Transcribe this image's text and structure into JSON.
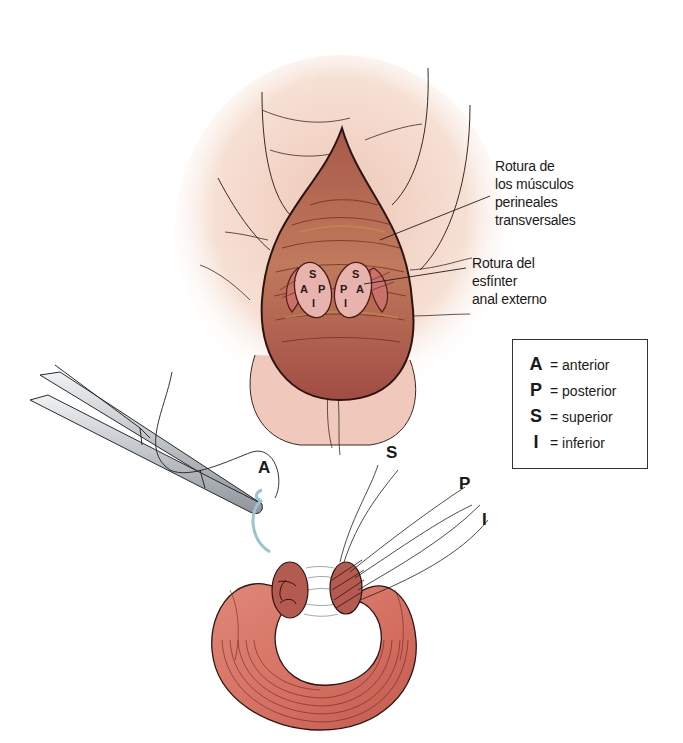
{
  "illustration": {
    "title": "Reparación de rotura del esfínter anal externo",
    "colors": {
      "skin": "#f1d4c4",
      "skin_shadow": "#e4b4a4",
      "wound": "#b0574a",
      "wound_dark": "#7a2e28",
      "muscle": "#d87a6c",
      "muscle_dark": "#a9493f",
      "instrument": "#c9ccd0",
      "suture_needle": "#9cc4cc",
      "line": "#1f1f1f"
    }
  },
  "callouts": {
    "perineal_muscles": {
      "lines": [
        "Rotura de",
        "los músculos",
        "perineales",
        "transversales"
      ]
    },
    "anal_sphincter": {
      "lines": [
        "Rotura del",
        "esfínter",
        "anal externo"
      ]
    }
  },
  "sphincter_ends_labels": {
    "left": {
      "top": "S",
      "left": "A",
      "right": "P",
      "bottom": "I"
    },
    "right": {
      "top": "S",
      "left": "P",
      "right": "A",
      "bottom": "I"
    }
  },
  "suture_labels": {
    "anterior": "A",
    "superior": "S",
    "posterior": "P",
    "inferior": "I"
  },
  "legend": {
    "items": [
      {
        "key": "A",
        "value": "= anterior"
      },
      {
        "key": "P",
        "value": "= posterior"
      },
      {
        "key": "S",
        "value": "= superior"
      },
      {
        "key": "I",
        "value": "= inferior"
      }
    ]
  }
}
